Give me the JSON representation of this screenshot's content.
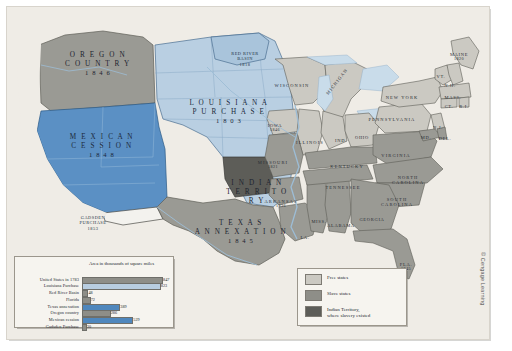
{
  "map": {
    "territories": [
      {
        "name": "oregon-country",
        "line1": "O R E G O N",
        "line2": "C O U N T R Y",
        "year": "1 8 4 6",
        "x": 48,
        "y": 44,
        "w": 86,
        "tone": "dark"
      },
      {
        "name": "louisiana-purchase",
        "line1": "L O U I S I A N A",
        "line2": "P U R C H A S E",
        "year": "1 8 0 3",
        "x": 176,
        "y": 92,
        "w": 92,
        "tone": "light"
      },
      {
        "name": "mexican-cession",
        "line1": "M E X I C A N",
        "line2": "C E S S I O N",
        "year": "1 8 4 8",
        "x": 56,
        "y": 126,
        "w": 78,
        "tone": "light"
      },
      {
        "name": "texas-annexation",
        "line1": "T E X A S",
        "line2": "A N N E X A T I O N",
        "year": "1 8 4 5",
        "x": 186,
        "y": 212,
        "w": 96,
        "tone": "dark"
      },
      {
        "name": "indian-territory",
        "line1": "I N D I A N",
        "line2": "T E R R I T O R Y",
        "year": "",
        "x": 216,
        "y": 172,
        "w": 68,
        "tone": "dark"
      }
    ],
    "small_territories": [
      {
        "name": "red-river-basin",
        "text": "RED RIVER\nBASIN\n1818",
        "x": 216,
        "y": 44,
        "w": 44
      },
      {
        "name": "gadsden-purchase",
        "text": "GADSDEN\nPURCHASE\n1853",
        "x": 62,
        "y": 208,
        "w": 48
      }
    ],
    "states": [
      {
        "name": "wisconsin",
        "label": "WISCONSIN",
        "year": "",
        "x": 285,
        "y": 76,
        "w": 42
      },
      {
        "name": "michigan",
        "label": "MICHIGAN",
        "year": "",
        "x": 330,
        "y": 72,
        "w": 34,
        "rot": -52
      },
      {
        "name": "iowa",
        "label": "IOWA",
        "year": "1846",
        "x": 268,
        "y": 116,
        "w": 22
      },
      {
        "name": "illinois",
        "label": "ILLINOIS",
        "year": "",
        "x": 303,
        "y": 133,
        "w": 30
      },
      {
        "name": "indiana",
        "label": "IND.",
        "year": "",
        "x": 334,
        "y": 131,
        "w": 16
      },
      {
        "name": "ohio",
        "label": "OHIO",
        "year": "",
        "x": 355,
        "y": 128,
        "w": 20
      },
      {
        "name": "missouri",
        "label": "MISSOURI",
        "year": "1821",
        "x": 266,
        "y": 153,
        "w": 34
      },
      {
        "name": "kentucky",
        "label": "KENTUCKY",
        "year": "",
        "x": 340,
        "y": 157,
        "w": 38
      },
      {
        "name": "tennessee",
        "label": "TENNESSEE",
        "year": "",
        "x": 336,
        "y": 178,
        "w": 42
      },
      {
        "name": "arkansas",
        "label": "ARKANSAS",
        "year": "1836",
        "x": 274,
        "y": 192,
        "w": 34
      },
      {
        "name": "mississippi",
        "label": "MISS.",
        "year": "",
        "x": 312,
        "y": 212,
        "w": 20
      },
      {
        "name": "alabama",
        "label": "ALABAMA",
        "year": "",
        "x": 334,
        "y": 216,
        "w": 32
      },
      {
        "name": "georgia",
        "label": "GEORGIA",
        "year": "",
        "x": 365,
        "y": 210,
        "w": 32
      },
      {
        "name": "louisiana",
        "label": "LA.",
        "year": "",
        "x": 298,
        "y": 228,
        "w": 14
      },
      {
        "name": "florida",
        "label": "FLA.",
        "year": "1845",
        "x": 399,
        "y": 255,
        "w": 18
      },
      {
        "name": "south-carolina",
        "label": "SOUTH\nCAROLINA",
        "year": "",
        "x": 390,
        "y": 190,
        "w": 34
      },
      {
        "name": "north-carolina",
        "label": "NORTH\nCAROLINA",
        "year": "",
        "x": 401,
        "y": 168,
        "w": 34
      },
      {
        "name": "virginia",
        "label": "VIRGINIA",
        "year": "",
        "x": 389,
        "y": 146,
        "w": 34
      },
      {
        "name": "pennsylvania",
        "label": "PENNSYLVANIA",
        "year": "",
        "x": 385,
        "y": 110,
        "w": 48
      },
      {
        "name": "new-york",
        "label": "NEW YORK",
        "year": "",
        "x": 395,
        "y": 88,
        "w": 38
      },
      {
        "name": "maine",
        "label": "MAINE",
        "year": "1820",
        "x": 452,
        "y": 45,
        "w": 24
      },
      {
        "name": "vermont",
        "label": "VT.",
        "year": "",
        "x": 434,
        "y": 67,
        "w": 12
      },
      {
        "name": "new-hampshire",
        "label": "N.H.",
        "year": "",
        "x": 443,
        "y": 76,
        "w": 13
      },
      {
        "name": "massachusetts",
        "label": "MASS.",
        "year": "",
        "x": 446,
        "y": 88,
        "w": 18
      },
      {
        "name": "connecticut",
        "label": "CT.",
        "year": "",
        "x": 442,
        "y": 97,
        "w": 11
      },
      {
        "name": "rhode-island",
        "label": "R.I.",
        "year": "",
        "x": 457,
        "y": 97,
        "w": 11
      },
      {
        "name": "new-jersey",
        "label": "N.J.",
        "year": "",
        "x": 431,
        "y": 118,
        "w": 12
      },
      {
        "name": "maryland",
        "label": "MD.",
        "year": "",
        "x": 419,
        "y": 128,
        "w": 13
      },
      {
        "name": "delaware",
        "label": "DEL.",
        "year": "",
        "x": 438,
        "y": 129,
        "w": 14
      }
    ]
  },
  "chart_data": {
    "type": "bar",
    "title": "Area in thousands\nof square miles",
    "orientation": "horizontal",
    "categories": [
      "United States in 1783",
      "Louisiana Purchase",
      "Red River Basin",
      "Florida",
      "Texas annexation",
      "Oregon country",
      "Mexican cession",
      "Gadsden Purchase"
    ],
    "values": [
      847,
      823,
      48,
      72,
      389,
      286,
      529,
      30
    ],
    "labels": [
      "847",
      "823",
      "48",
      "72",
      "389",
      "286",
      "529",
      "30"
    ],
    "colors": [
      "#8e8e88",
      "#b8cde0",
      "#8e8e88",
      "#8e8e88",
      "#4f87bd",
      "#8e8e88",
      "#4f87bd",
      "#8e8e88"
    ],
    "xlabel": "",
    "ylabel": "",
    "xlim": [
      0,
      900
    ],
    "grid": false
  },
  "legend": {
    "title": "",
    "items": [
      {
        "name": "free-states",
        "label": "Free states",
        "color": "#cbc9c2"
      },
      {
        "name": "slave-states",
        "label": "Slave states",
        "color": "#8e8e88"
      },
      {
        "name": "indian-territory",
        "label": "Indian Territory,\nwhere slavery existed",
        "color": "#5d5d58"
      }
    ]
  },
  "credit": {
    "text": "© Cengage Learning"
  },
  "colors": {
    "free_states": "#cbc9c2",
    "slave_states": "#8e8e88",
    "indian_territory": "#5d5d58",
    "acquired_blue": "#5b90c4",
    "light_blue": "#b9cfe2",
    "water": "#c9dcea",
    "background": "#efece6"
  }
}
